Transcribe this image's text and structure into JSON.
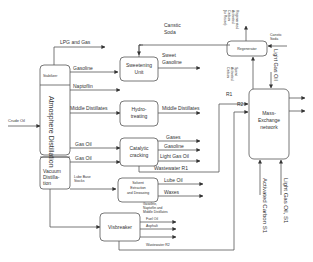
{
  "diagram": {
    "inputs": {
      "crude_oil": "Crude Oil"
    },
    "units": {
      "stabilizer": "Stabilizer",
      "atmospheric_distillation": "Atmosphere Distillation",
      "vacuum_distillation": [
        "Vacuum",
        "Distilla-",
        "tion"
      ],
      "sweetening": [
        "Sweetening",
        "Unit"
      ],
      "hydrotreating": [
        "Hydro-",
        "treating"
      ],
      "catalytic_cracking": [
        "Catalytic",
        "cracking"
      ],
      "solvent_extraction": [
        "Solvent",
        "Extraction",
        "and Dewaxing"
      ],
      "visbreaker": "Visbreaker",
      "regenerator": "Regenerator",
      "mass_exchange": [
        "Mass-",
        "Exchange",
        "network"
      ]
    },
    "streams": {
      "lpg_gas": "LPG and Gas",
      "gasoline": "Gasoline",
      "naptoflin": "Naptoflin",
      "middle_distillates_in": "Middle Distillates",
      "middle_distillates_out": "Middle Distillates",
      "gas_oil_1": "Gas Oil",
      "gas_oil_2": "Gas Oil",
      "lube_base_stocks": [
        "Lube Base",
        "Stocks"
      ],
      "caustic_soda_top": [
        "Canstic",
        "Soda"
      ],
      "sweet_gasoline": [
        "Sweet",
        "Gasoline"
      ],
      "caustic_soda_right": [
        "Canstic",
        "Soda"
      ],
      "regenerated_carbon": [
        "Regenerated",
        "Activated",
        "Carbon",
        "(to Reuse)"
      ],
      "spent_carbon": [
        "Spent",
        "Activated",
        "Carbon"
      ],
      "light_gas_oil_right": "Light Gas Oil",
      "r1": "R1",
      "r2": "R2",
      "gases": "Gases",
      "cc_gasoline": "Gasoline",
      "light_gas_oil": "Light Gas Oil",
      "wastewater_r1": "Wastewater R1",
      "lube_oil": "Lube Oil",
      "waxes": "Waxes",
      "visbreaker_products": [
        "Gasoline,",
        "Naptoflin and",
        "Middle Distillates"
      ],
      "fuel_oil": "Fuel Oil",
      "asphalt": "Asphalt",
      "wastewater_r2": "Wastewater R2",
      "activated_carbon_s1": "Activated Carbon S1",
      "light_gas_oil_s1": "Light Gas Oil, S1"
    }
  }
}
